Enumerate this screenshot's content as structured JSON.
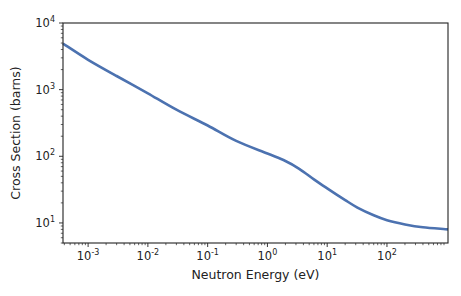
{
  "chart_data": {
    "type": "line",
    "title": "",
    "xlabel": "Neutron Energy (eV)",
    "ylabel": "Cross Section (barns)",
    "xscale": "log",
    "yscale": "log",
    "xlim": [
      0.00038,
      1050
    ],
    "ylim": [
      5,
      10000
    ],
    "grid": false,
    "legend": null,
    "x_ticks": [
      {
        "base": "10",
        "exp": "-3",
        "value": 0.001
      },
      {
        "base": "10",
        "exp": "-2",
        "value": 0.01
      },
      {
        "base": "10",
        "exp": "-1",
        "value": 0.1
      },
      {
        "base": "10",
        "exp": "0",
        "value": 1
      },
      {
        "base": "10",
        "exp": "1",
        "value": 10
      },
      {
        "base": "10",
        "exp": "2",
        "value": 100
      }
    ],
    "y_ticks": [
      {
        "base": "10",
        "exp": "1",
        "value": 10
      },
      {
        "base": "10",
        "exp": "2",
        "value": 100
      },
      {
        "base": "10",
        "exp": "3",
        "value": 1000
      },
      {
        "base": "10",
        "exp": "4",
        "value": 10000
      }
    ],
    "series": [
      {
        "name": "cross-section",
        "color": "#4c72b0",
        "x": [
          0.00038,
          0.001,
          0.003,
          0.01,
          0.03,
          0.1,
          0.3,
          1,
          2,
          3.4,
          6,
          10,
          20,
          32,
          60,
          100,
          200,
          400,
          1050
        ],
        "values": [
          4900,
          2800,
          1600,
          880,
          500,
          290,
          170,
          110,
          85,
          65,
          45,
          33,
          22,
          17,
          13,
          11,
          9.5,
          8.6,
          8
        ]
      }
    ]
  }
}
